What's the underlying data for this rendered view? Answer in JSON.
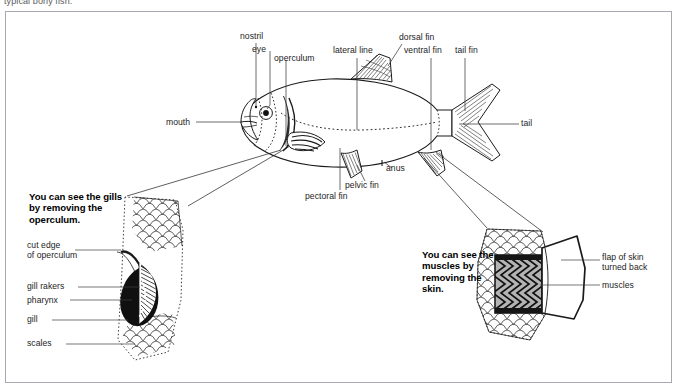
{
  "page": {
    "top_caption": "typical bony fish."
  },
  "fish_labels": [
    {
      "key": "nostril",
      "text": "nostril"
    },
    {
      "key": "eye",
      "text": "eye"
    },
    {
      "key": "operculum",
      "text": "operculum"
    },
    {
      "key": "lateral_line",
      "text": "lateral line"
    },
    {
      "key": "dorsal_fin",
      "text": "dorsal fin"
    },
    {
      "key": "ventral_fin",
      "text": "ventral fin"
    },
    {
      "key": "tail_fin",
      "text": "tail fin"
    },
    {
      "key": "tail",
      "text": "tail"
    },
    {
      "key": "mouth",
      "text": "mouth"
    },
    {
      "key": "pectoral_fin",
      "text": "pectoral fin"
    },
    {
      "key": "pelvic_fin",
      "text": "pelvic fin"
    },
    {
      "key": "anus",
      "text": "anus"
    }
  ],
  "gill_panel": {
    "heading": "You can see the gills by removing the operculum.",
    "labels": [
      {
        "key": "cut_edge",
        "text": "cut edge\nof operculum"
      },
      {
        "key": "gill_rakers",
        "text": "gill rakers"
      },
      {
        "key": "pharynx",
        "text": "pharynx"
      },
      {
        "key": "gill",
        "text": "gill"
      },
      {
        "key": "scales",
        "text": "scales"
      }
    ]
  },
  "muscle_panel": {
    "heading": "You can see the muscles by removing the skin.",
    "labels": [
      {
        "key": "flap_of_skin",
        "text": "flap of skin\nturned back"
      },
      {
        "key": "muscles",
        "text": "muscles"
      }
    ]
  },
  "colors": {
    "ink": "#1a1a1a",
    "frame": "#a8a8b0",
    "leader": "#3c3c3c",
    "muscle_fill": "#b4b4b4",
    "caption": "#5a5a5a",
    "paper": "#ffffff"
  }
}
